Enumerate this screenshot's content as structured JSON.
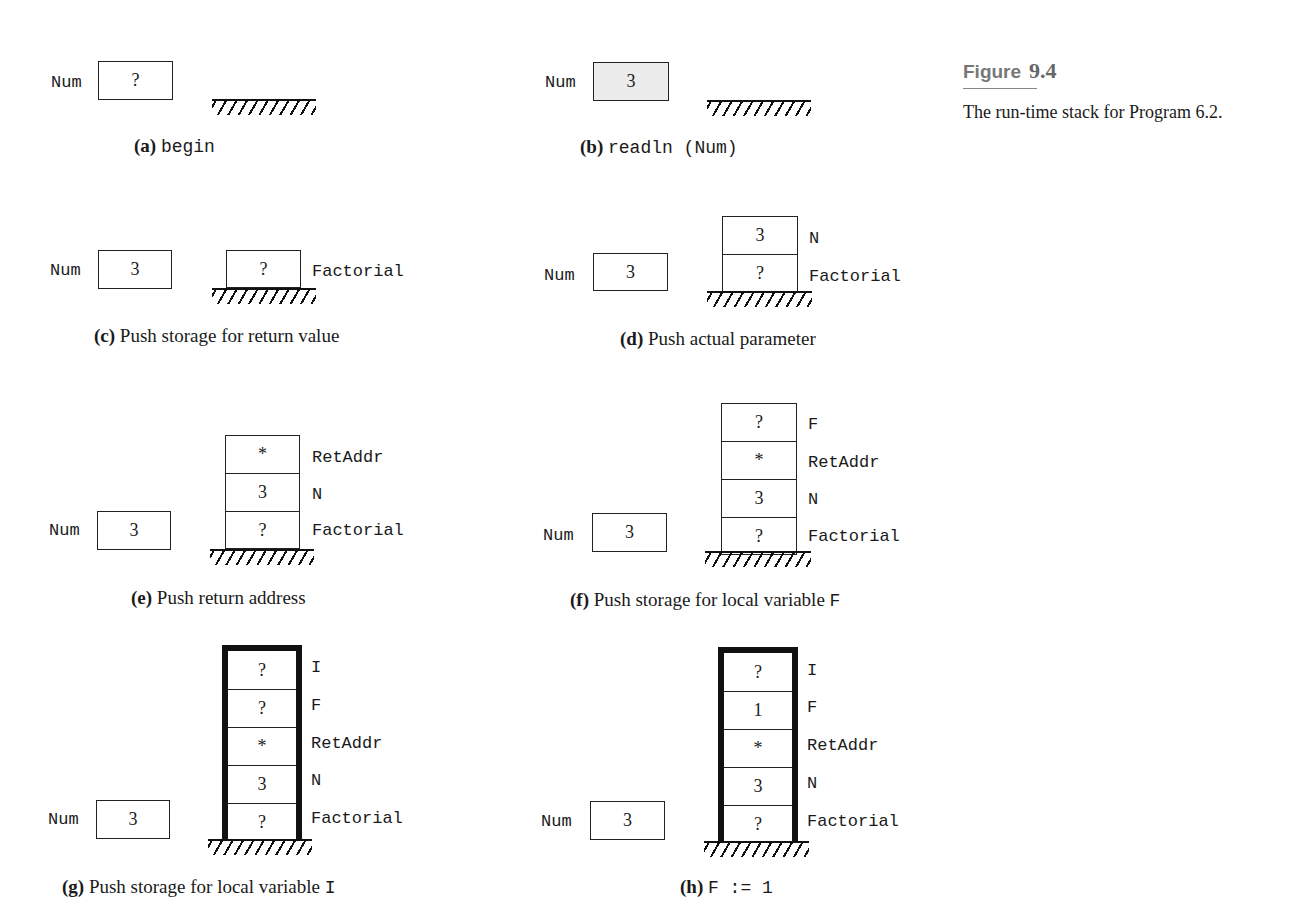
{
  "figure": {
    "label": "Figure",
    "number": "9.4",
    "caption": "The run-time stack for Program 6.2."
  },
  "panels": [
    {
      "id": "a",
      "tag": "(a)",
      "caption_text": "",
      "caption_code": "begin",
      "num": {
        "label": "Num",
        "value": "?",
        "shaded": false
      },
      "stack": []
    },
    {
      "id": "b",
      "tag": "(b)",
      "caption_text": "",
      "caption_code": "readln (Num)",
      "num": {
        "label": "Num",
        "value": "3",
        "shaded": true
      },
      "stack": []
    },
    {
      "id": "c",
      "tag": "(c)",
      "caption_text": "Push storage for return value",
      "caption_code": "",
      "num": {
        "label": "Num",
        "value": "3",
        "shaded": false
      },
      "stack": [
        {
          "value": "?",
          "label": "Factorial"
        }
      ]
    },
    {
      "id": "d",
      "tag": "(d)",
      "caption_text": "Push actual parameter",
      "caption_code": "",
      "num": {
        "label": "Num",
        "value": "3",
        "shaded": false
      },
      "stack": [
        {
          "value": "3",
          "label": "N"
        },
        {
          "value": "?",
          "label": "Factorial"
        }
      ]
    },
    {
      "id": "e",
      "tag": "(e)",
      "caption_text": "Push return address",
      "caption_code": "",
      "num": {
        "label": "Num",
        "value": "3",
        "shaded": false
      },
      "stack": [
        {
          "value": "*",
          "label": "RetAddr"
        },
        {
          "value": "3",
          "label": "N"
        },
        {
          "value": "?",
          "label": "Factorial"
        }
      ]
    },
    {
      "id": "f",
      "tag": "(f)",
      "caption_text": "Push storage for local variable",
      "caption_code": "F",
      "num": {
        "label": "Num",
        "value": "3",
        "shaded": false
      },
      "stack": [
        {
          "value": "?",
          "label": "F"
        },
        {
          "value": "*",
          "label": "RetAddr"
        },
        {
          "value": "3",
          "label": "N"
        },
        {
          "value": "?",
          "label": "Factorial"
        }
      ]
    },
    {
      "id": "g",
      "tag": "(g)",
      "caption_text": "Push storage for local variable",
      "caption_code": "I",
      "num": {
        "label": "Num",
        "value": "3",
        "shaded": false
      },
      "stack": [
        {
          "value": "?",
          "label": "I"
        },
        {
          "value": "?",
          "label": "F"
        },
        {
          "value": "*",
          "label": "RetAddr"
        },
        {
          "value": "3",
          "label": "N"
        },
        {
          "value": "?",
          "label": "Factorial"
        }
      ]
    },
    {
      "id": "h",
      "tag": "(h)",
      "caption_text": "",
      "caption_code": "F := 1",
      "num": {
        "label": "Num",
        "value": "3",
        "shaded": false
      },
      "stack": [
        {
          "value": "?",
          "label": "I"
        },
        {
          "value": "1",
          "label": "F",
          "shaded": true
        },
        {
          "value": "*",
          "label": "RetAddr"
        },
        {
          "value": "3",
          "label": "N"
        },
        {
          "value": "?",
          "label": "Factorial"
        }
      ]
    }
  ]
}
